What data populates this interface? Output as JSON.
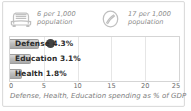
{
  "card": {
    "background": "#ffffff",
    "border_color": "#dcdcdc"
  },
  "stats": [
    {
      "icon": "car-icon",
      "value": "6 per 1,000",
      "unit": "population"
    },
    {
      "icon": "ring-oval-icon",
      "value": "17 per 1,000",
      "unit": "population"
    }
  ],
  "chart_data": {
    "type": "bar",
    "orientation": "horizontal",
    "title": "",
    "caption": "Defense, Health, Education spending as % of GDP",
    "xlabel": "",
    "ylabel": "",
    "categories": [
      "Defense",
      "Education",
      "Health"
    ],
    "values": [
      4.3,
      3.1,
      1.8
    ],
    "value_labels": [
      "4.3%",
      "3.1%",
      "1.8%"
    ],
    "bar_labels": [
      "Defense 4.3%",
      "Education 3.1%",
      "Health 1.8%"
    ],
    "xlim": [
      0,
      25
    ],
    "xticks": [
      0,
      5,
      10,
      15,
      20,
      25
    ],
    "xtick_labels": [
      "0",
      "5",
      "10",
      "15",
      "20",
      "25"
    ],
    "grid": true,
    "legend": false,
    "bar_color": "#bdbdbd",
    "bar_border_color": "#9e9e9e"
  },
  "cursor": {
    "name": "mouse-cursor-overlay",
    "color": "#2e2e2e"
  }
}
